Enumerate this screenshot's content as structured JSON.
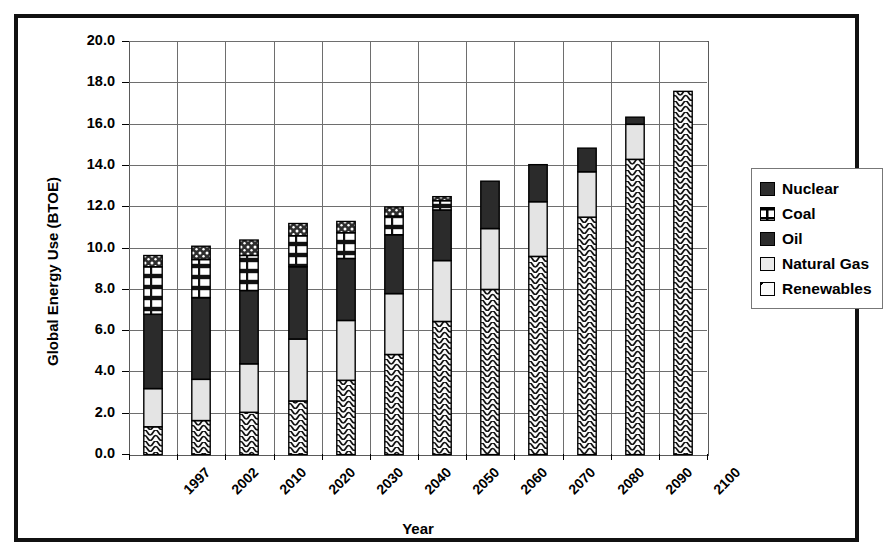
{
  "chart_data": {
    "type": "bar",
    "stacked": true,
    "title": "",
    "xlabel": "Year",
    "ylabel": "Global Energy Use (BTOE)",
    "ylim": [
      0.0,
      20.0
    ],
    "yticks": [
      "0.0",
      "2.0",
      "4.0",
      "6.0",
      "8.0",
      "10.0",
      "12.0",
      "14.0",
      "16.0",
      "18.0",
      "20.0"
    ],
    "ytick_step": 2.0,
    "grid": "horizontal-and-vertical",
    "legend_position": "right",
    "categories": [
      "1997",
      "2002",
      "2010",
      "2020",
      "2030",
      "2040",
      "2050",
      "2060",
      "2070",
      "2080",
      "2090",
      "2100"
    ],
    "series": [
      {
        "name": "Renewables",
        "pattern": "wavy-diagonal",
        "color": "#fafafa",
        "values": [
          1.35,
          1.65,
          2.05,
          2.6,
          3.6,
          4.85,
          6.45,
          8.0,
          9.6,
          11.5,
          14.3,
          17.6
        ]
      },
      {
        "name": "Natural Gas",
        "pattern": "solid-light",
        "color": "#e4e4e4",
        "values": [
          1.85,
          2.0,
          2.35,
          3.0,
          2.9,
          2.95,
          2.95,
          2.95,
          2.65,
          2.2,
          1.7,
          0.0
        ]
      },
      {
        "name": "Oil",
        "pattern": "solid-dark",
        "color": "#2b2b2b",
        "values": [
          3.6,
          3.95,
          3.55,
          3.5,
          3.0,
          2.85,
          2.45,
          2.3,
          1.8,
          1.15,
          0.35,
          0.0
        ]
      },
      {
        "name": "Coal",
        "pattern": "horizontal-brick",
        "color": "#ffffff",
        "values": [
          2.3,
          1.85,
          1.7,
          1.5,
          1.25,
          0.9,
          0.45,
          0.0,
          0.0,
          0.0,
          0.0,
          0.0
        ]
      },
      {
        "name": "Nuclear",
        "pattern": "speckled-dark",
        "color": "#3a3a3a",
        "values": [
          0.55,
          0.65,
          0.75,
          0.6,
          0.55,
          0.45,
          0.2,
          0.0,
          0.0,
          0.0,
          0.0,
          0.0
        ]
      }
    ],
    "totals": [
      9.65,
      10.1,
      10.4,
      11.2,
      11.3,
      11.9,
      12.5,
      13.25,
      14.05,
      14.85,
      16.35,
      17.6
    ]
  },
  "legend": {
    "items": [
      {
        "label": "Nuclear"
      },
      {
        "label": "Coal"
      },
      {
        "label": "Oil"
      },
      {
        "label": "Natural Gas"
      },
      {
        "label": "Renewables"
      }
    ]
  }
}
